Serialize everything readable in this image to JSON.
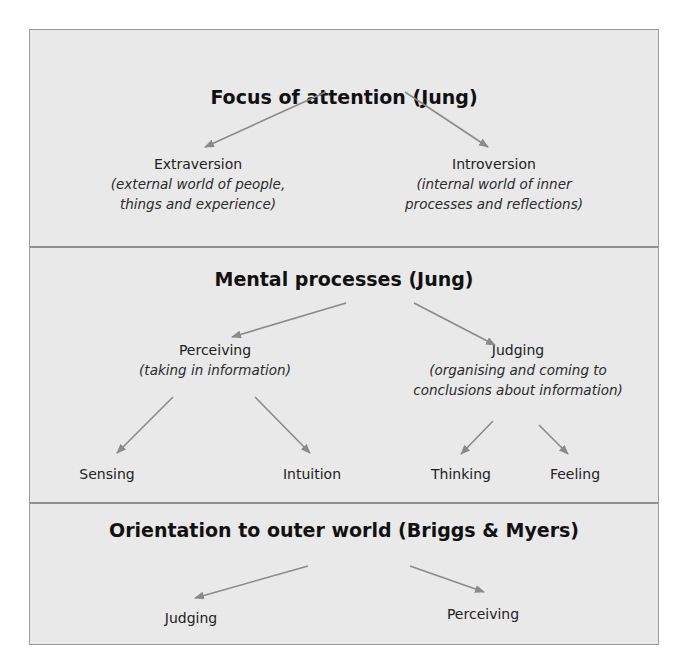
{
  "sections": [
    {
      "title": "Focus of attention (Jung)",
      "nodes": [
        {
          "label": "Extraversion",
          "desc_lines": [
            "(external world of people,",
            "things and experience)"
          ]
        },
        {
          "label": "Introversion",
          "desc_lines": [
            "(internal world of inner",
            "processes and reflections)"
          ]
        }
      ]
    },
    {
      "title": "Mental processes (Jung)",
      "nodes": [
        {
          "label": "Perceiving",
          "desc_lines": [
            "(taking in information)"
          ]
        },
        {
          "label": "Judging",
          "desc_lines": [
            "(organising and coming to",
            "conclusions about information)"
          ]
        }
      ],
      "leaves": [
        {
          "label": "Sensing"
        },
        {
          "label": "Intuition"
        },
        {
          "label": "Thinking"
        },
        {
          "label": "Feeling"
        }
      ]
    },
    {
      "title": "Orientation to outer world (Briggs & Myers)",
      "nodes": [
        {
          "label": "Judging"
        },
        {
          "label": "Perceiving"
        }
      ]
    }
  ],
  "colors": {
    "background": "#e9e9e9",
    "border": "#9a9a9a",
    "arrow": "#8a8a8a",
    "title_text": "#111111"
  }
}
